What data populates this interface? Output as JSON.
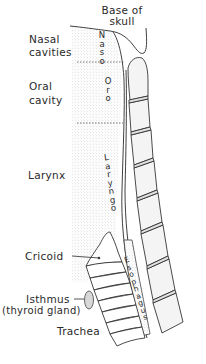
{
  "diagram": {
    "title": "",
    "colors": {
      "ink": "#2a2a2a",
      "stipple": "#c9c9c9",
      "bone_fill": "#f1f1f1",
      "background": "#ffffff"
    },
    "labels": {
      "base_of_skull_line1": "Base of",
      "base_of_skull_line2": "skull",
      "nasal_cavities_line1": "Nasal",
      "nasal_cavities_line2": "cavities",
      "oral_cavity_line1": "Oral",
      "oral_cavity_line2": "cavity",
      "larynx": "Larynx",
      "cricoid": "Cricoid",
      "isthmus": "Isthmus",
      "thyroid_gland": "(thyroid gland)",
      "trachea": "Trachea"
    },
    "vertical_labels": {
      "naso": "N\na\ns\no",
      "oro": "O\nr\no",
      "laryngo": "L\na\nr\ny\nn\ng\no",
      "esophagus": "E\ns\no\np\nh\na\ng\nu\ns"
    },
    "regions": [
      {
        "name": "Nasopharynx",
        "label": "Naso"
      },
      {
        "name": "Oropharynx",
        "label": "Oro"
      },
      {
        "name": "Laryngopharynx",
        "label": "Laryngo"
      },
      {
        "name": "Esophagus",
        "label": "Esophagus"
      }
    ]
  }
}
